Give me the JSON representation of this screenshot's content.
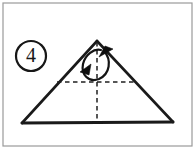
{
  "diagram": {
    "step_number": "4",
    "background_color": "#ffffff",
    "ink_color": "#1a1a1a",
    "frame_color": "#9a9a9a",
    "frame": {
      "name": "panel-border",
      "x": 3,
      "y": 3,
      "width": 189,
      "height": 143
    },
    "step_badge": {
      "label": "4",
      "circle_cx": 31,
      "circle_cy": 56,
      "circle_rx": 15,
      "circle_ry": 15
    },
    "shape": {
      "name": "triangle",
      "apex": {
        "x": 97,
        "y": 41
      },
      "left_vertex": {
        "x": 22,
        "y": 123
      },
      "right_vertex": {
        "x": 173,
        "y": 122
      },
      "left_edge_path": "M 97 41 L 22 123",
      "right_edge_path": "M 97 41 L 173 122",
      "base_path": "M 22 123 L 173 122"
    },
    "creases": [
      {
        "name": "vertical-center-crease",
        "style": "dashed",
        "path": "M 97 42 L 97 122"
      },
      {
        "name": "horizontal-crease",
        "style": "dashed",
        "path": "M 57 82 L 137 82"
      }
    ],
    "fold_arrow": {
      "name": "fold-over-arrow",
      "style": "curved-double-arrow-loop",
      "loop_path": "M 104 51 C 112 60, 110 74, 99 79 C 88 83, 81 74, 83 64 C 85 55, 94 48, 101 50",
      "head_down_left": "M 91 64 L 80 72 L 89 75 Z",
      "head_up_right": "M 99 57 L 113 49 L 105 46 Z"
    }
  }
}
